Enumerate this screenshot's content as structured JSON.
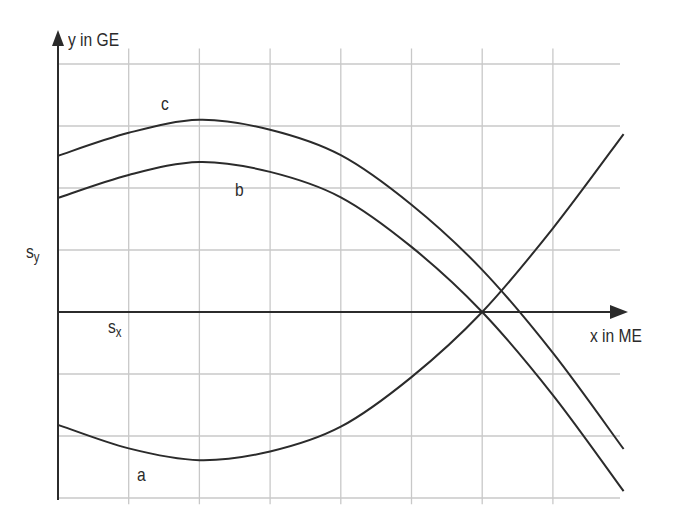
{
  "chart_data": {
    "type": "line",
    "title": "",
    "xlabel": "x in ME",
    "ylabel": "y in GE",
    "grid": true,
    "xlim": [
      0,
      8
    ],
    "ylim": [
      -3,
      4
    ],
    "x": [
      0,
      1,
      2,
      3,
      4,
      5,
      6,
      7,
      8
    ],
    "series": [
      {
        "name": "a",
        "values": [
          -1.82,
          -2.2,
          -2.39,
          -2.25,
          -1.85,
          -1.05,
          0,
          1.35,
          2.87
        ]
      },
      {
        "name": "b",
        "values": [
          1.84,
          2.21,
          2.42,
          2.26,
          1.85,
          1.05,
          0,
          -1.34,
          -2.89
        ]
      },
      {
        "name": "c",
        "values": [
          2.52,
          2.89,
          3.1,
          2.94,
          2.53,
          1.73,
          0.68,
          -0.66,
          -2.21
        ]
      }
    ],
    "annotations": [
      {
        "text": "a",
        "x": 1.2,
        "y": -2.6
      },
      {
        "text": "b",
        "x": 2.55,
        "y": 2.0
      },
      {
        "text": "c",
        "x": 1.55,
        "y": 3.4
      },
      {
        "text": "s",
        "sub": "y",
        "position": "left of y-axis at y=1"
      },
      {
        "text": "s",
        "sub": "x",
        "position": "below x-axis at x=1"
      }
    ]
  },
  "labels": {
    "y_axis": "y in GE",
    "x_axis": "x in ME",
    "sy_main": "s",
    "sy_sub": "y",
    "sx_main": "s",
    "sx_sub": "x",
    "curve_a": "a",
    "curve_b": "b",
    "curve_c": "c"
  },
  "colors": {
    "curve": "#2b2b2b",
    "axis": "#2b2b2b",
    "grid": "#c8c8c8"
  }
}
